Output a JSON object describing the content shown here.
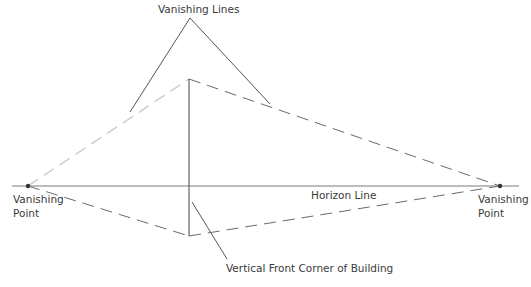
{
  "labels": {
    "vanishing_lines": "Vanishing Lines",
    "horizon_line": "Horizon Line",
    "left_vp_line1": "Vanishing",
    "left_vp_line2": "Point",
    "right_vp_line1": "Vanishing",
    "right_vp_line2": "Point",
    "vertical_corner": "Vertical Front Corner of Building"
  },
  "colors": {
    "line": "#555555",
    "dash_light": "#bfbfbf",
    "dash_dark": "#6a6a6a",
    "point": "#333333"
  }
}
